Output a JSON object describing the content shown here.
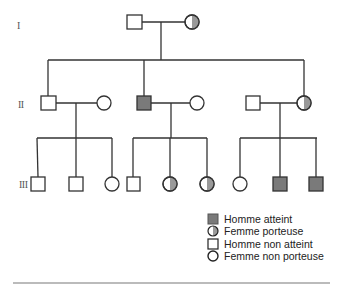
{
  "colors": {
    "line": "#333333",
    "affected": "#7a7a7a",
    "carrier_half": "#999999",
    "unaffected": "#ffffff"
  },
  "generations": [
    {
      "label": "I"
    },
    {
      "label": "II"
    },
    {
      "label": "III"
    }
  ],
  "pedigree": {
    "generation_I": [
      {
        "id": "I-1",
        "sex": "male",
        "status": "homme non atteint"
      },
      {
        "id": "I-2",
        "sex": "female",
        "status": "femme porteuse"
      }
    ],
    "generation_II": [
      {
        "id": "II-1",
        "sex": "male",
        "status": "homme non atteint",
        "parents": "I-1 x I-2"
      },
      {
        "id": "II-2",
        "sex": "female",
        "status": "femme non porteuse",
        "spouse_of": "II-1"
      },
      {
        "id": "II-3",
        "sex": "male",
        "status": "homme atteint",
        "parents": "I-1 x I-2"
      },
      {
        "id": "II-4",
        "sex": "female",
        "status": "femme non porteuse",
        "spouse_of": "II-3"
      },
      {
        "id": "II-5",
        "sex": "male",
        "status": "homme non atteint",
        "spouse_of": "II-6"
      },
      {
        "id": "II-6",
        "sex": "female",
        "status": "femme porteuse",
        "parents": "I-1 x I-2"
      }
    ],
    "generation_III": [
      {
        "id": "III-1",
        "sex": "male",
        "status": "homme non atteint",
        "parents": "II-1 x II-2"
      },
      {
        "id": "III-2",
        "sex": "male",
        "status": "homme non atteint",
        "parents": "II-1 x II-2"
      },
      {
        "id": "III-3",
        "sex": "female",
        "status": "femme non porteuse",
        "parents": "II-1 x II-2"
      },
      {
        "id": "III-4",
        "sex": "male",
        "status": "homme non atteint",
        "parents": "II-3 x II-4"
      },
      {
        "id": "III-5",
        "sex": "female",
        "status": "femme porteuse",
        "parents": "II-3 x II-4"
      },
      {
        "id": "III-6",
        "sex": "female",
        "status": "femme porteuse",
        "parents": "II-3 x II-4"
      },
      {
        "id": "III-7",
        "sex": "female",
        "status": "femme non porteuse",
        "parents": "II-5 x II-6"
      },
      {
        "id": "III-8",
        "sex": "male",
        "status": "homme atteint",
        "parents": "II-5 x II-6"
      },
      {
        "id": "III-9",
        "sex": "male",
        "status": "homme atteint",
        "parents": "II-5 x II-6"
      }
    ]
  },
  "legend": {
    "items": [
      {
        "symbol": "filled-square",
        "label": "Homme atteint"
      },
      {
        "symbol": "half-filled-circle",
        "label": "Femme porteuse"
      },
      {
        "symbol": "empty-square",
        "label": "Homme non atteint"
      },
      {
        "symbol": "empty-circle",
        "label": "Femme non porteuse"
      }
    ]
  }
}
